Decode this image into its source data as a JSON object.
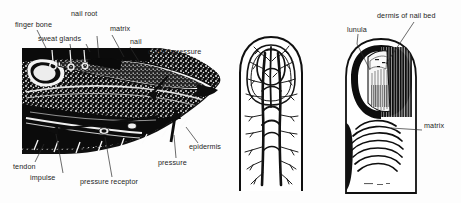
{
  "figure": {
    "background_color": "#fdfdfd",
    "ink_color": "#111111",
    "label_color": "#242424",
    "panels": [
      {
        "id": "sagittal-section",
        "name": "Sagittal section of fingertip",
        "description": "Black and white engraving cross-section through a fingertip showing the finger bone, sweat glands, nail root, matrix, nail, epidermis, tendon, pressure receptor and force arrows"
      },
      {
        "id": "vascular-fingertip",
        "name": "Fingertip blood vessel network",
        "description": "Outline drawing of a fingertip from above with the branching arterial and venous network of the nail bed"
      },
      {
        "id": "nail-surface",
        "name": "Fingernail surface view",
        "description": "Drawing of a fingernail partly cut away showing the lunula, the dermis of the nail bed and the matrix"
      }
    ]
  },
  "labels": {
    "finger_bone": "finger bone",
    "sweat_glands": "sweat glands",
    "nail_root": "nail root",
    "matrix": "matrix",
    "nail": "nail",
    "counterpressure": "counterpressure",
    "epidermis": "epidermis",
    "pressure": "pressure",
    "pressure_receptor": "pressure receptor",
    "impulse": "impulse",
    "tendon": "tendon",
    "lunula": "lunula",
    "dermis_of_nail_bed": "dermis of nail bed",
    "matrix_right": "matrix"
  }
}
